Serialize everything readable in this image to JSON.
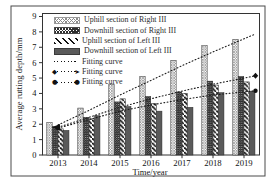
{
  "chart_data": {
    "type": "bar",
    "title": "",
    "xlabel": "Time/year",
    "ylabel": "Average rutting depth/mm",
    "ylim": [
      0,
      9
    ],
    "yticks": [
      0,
      1,
      2,
      3,
      4,
      5,
      6,
      7,
      8,
      9
    ],
    "categories": [
      "2013",
      "2014",
      "2015",
      "2016",
      "2017",
      "2018",
      "2019"
    ],
    "series": [
      {
        "name": "Uphill section of Right III",
        "pattern": "crosshatch-light",
        "values": [
          2.1,
          3.05,
          4.6,
          5.1,
          6.15,
          7.1,
          7.5
        ]
      },
      {
        "name": "Downhill section of Right III",
        "pattern": "crosshatch-dark",
        "values": [
          1.85,
          2.45,
          3.45,
          3.8,
          4.1,
          4.8,
          5.1
        ]
      },
      {
        "name": "Uphill section of Left III",
        "pattern": "diagonal-stripes",
        "values": [
          1.7,
          2.35,
          3.65,
          3.35,
          4.0,
          4.55,
          4.75
        ]
      },
      {
        "name": "Downhill section of Left III",
        "pattern": "solid-gray",
        "values": [
          1.6,
          2.55,
          3.15,
          2.85,
          3.1,
          4.05,
          4.15
        ]
      }
    ],
    "fitting_curves": [
      {
        "name": "Fitting curve",
        "style": "dotted",
        "marker_start": "none",
        "marker_end": "none",
        "values": [
          1.95,
          2.9,
          3.9,
          4.85,
          5.8,
          6.7,
          7.55
        ]
      },
      {
        "name": "Fitting curve",
        "style": "dotted",
        "marker_start": "arrow-left",
        "marker_end": "diamond",
        "values": [
          1.8,
          2.45,
          3.1,
          3.65,
          4.15,
          4.6,
          5.0
        ]
      },
      {
        "name": "Fitting curve",
        "style": "dotted",
        "marker_start": "circle",
        "marker_end": "circle",
        "values": [
          1.75,
          2.3,
          2.85,
          3.25,
          3.6,
          3.9,
          4.1
        ]
      }
    ],
    "legend_position": "top-left",
    "grid": false,
    "colors": {
      "ink": "#1a1a1a",
      "bar_solid": "#5a5a5a",
      "hatch_light": "#8c8c8c",
      "hatch_dark": "#2e2e2e",
      "background": "#ffffff"
    }
  }
}
